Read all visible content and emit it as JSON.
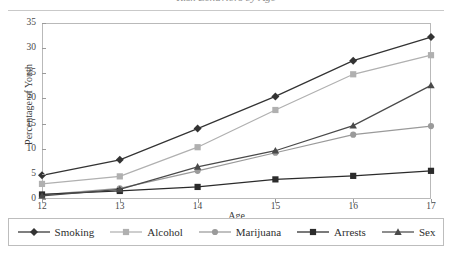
{
  "chart": {
    "title": "Risk Behaviors by Age",
    "title_clipped": true
  },
  "axes": {
    "x_title": "Age",
    "y_title": "Percentage of Youth",
    "x_ticks": [
      "12",
      "13",
      "14",
      "15",
      "16",
      "17"
    ],
    "y_ticks": [
      "0",
      "5",
      "10",
      "15",
      "20",
      "25",
      "30",
      "35"
    ]
  },
  "legend": {
    "items": [
      {
        "label": "Smoking",
        "marker": "diamond-marker",
        "color": "#333333"
      },
      {
        "label": "Alcohol",
        "marker": "square-marker",
        "color": "#b0b0b0"
      },
      {
        "label": "Marijuana",
        "marker": "circle-marker",
        "color": "#9a9a9a"
      },
      {
        "label": "Arrests",
        "marker": "square-marker",
        "color": "#2b2b2b"
      },
      {
        "label": "Sex",
        "marker": "triangle-marker",
        "color": "#4a4a4a"
      }
    ]
  },
  "chart_data": {
    "type": "line",
    "title": "Risk Behaviors by Age",
    "xlabel": "Age",
    "ylabel": "Percentage of Youth",
    "x": [
      12,
      13,
      14,
      15,
      16,
      17
    ],
    "xlim": [
      12,
      17
    ],
    "ylim": [
      0,
      35
    ],
    "ytick_step": 5,
    "grid": false,
    "legend_position": "bottom",
    "series": [
      {
        "name": "Smoking",
        "color": "#333333",
        "marker": "diamond",
        "values": [
          4.7,
          7.8,
          14.0,
          20.4,
          27.5,
          32.2
        ]
      },
      {
        "name": "Alcohol",
        "color": "#b0b0b0",
        "marker": "square",
        "values": [
          3.0,
          4.5,
          10.3,
          17.7,
          24.8,
          28.6
        ]
      },
      {
        "name": "Marijuana",
        "color": "#9a9a9a",
        "marker": "circle",
        "values": [
          0.8,
          2.1,
          5.6,
          9.2,
          12.8,
          14.5
        ]
      },
      {
        "name": "Arrests",
        "color": "#2b2b2b",
        "marker": "square",
        "values": [
          0.9,
          1.6,
          2.4,
          3.9,
          4.6,
          5.6
        ]
      },
      {
        "name": "Sex",
        "color": "#4a4a4a",
        "marker": "triangle",
        "values": [
          0.6,
          1.9,
          6.4,
          9.6,
          14.6,
          22.6
        ]
      }
    ]
  }
}
